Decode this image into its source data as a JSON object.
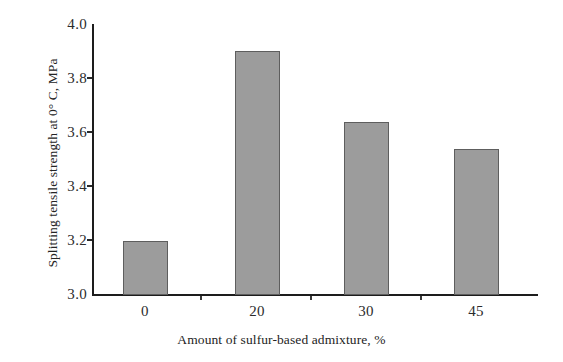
{
  "chart_data": {
    "type": "bar",
    "title": "",
    "categories": [
      "0",
      "20",
      "30",
      "45"
    ],
    "values": [
      3.2,
      3.9,
      3.64,
      3.54
    ],
    "xlabel": "Amount of sulfur-based admixture, %",
    "ylabel": "Splitting tensile strength at 0° C, MPa",
    "ylim": [
      3.0,
      4.0
    ],
    "yticks": [
      "3.0",
      "3.2",
      "3.4",
      "3.6",
      "3.8",
      "4.0"
    ],
    "ytick_values": [
      3.0,
      3.2,
      3.4,
      3.6,
      3.8,
      4.0
    ],
    "grid": false,
    "legend": null,
    "bar_color": "#9c9c9c",
    "bar_edge_color": "#5e5e5e",
    "axis_color": "#1d1d1d"
  }
}
